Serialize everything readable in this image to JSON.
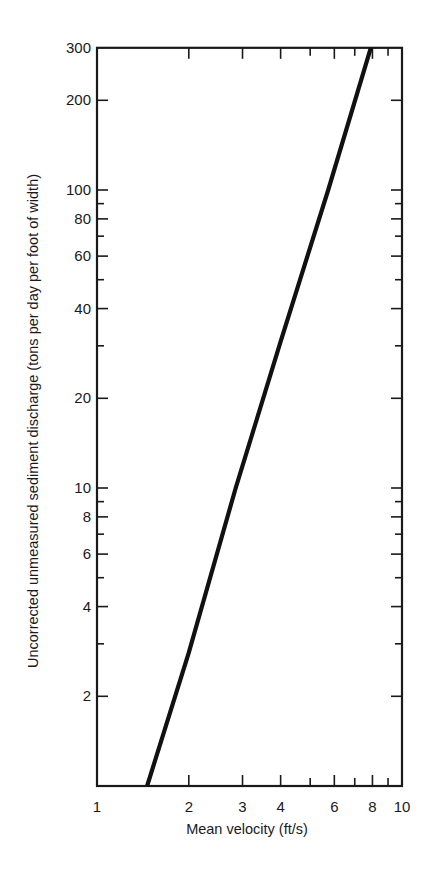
{
  "chart_data": {
    "type": "line",
    "title": "",
    "xlabel": "Mean velocity (ft/s)",
    "ylabel": "Uncorrected unmeasured sediment discharge (tons per day per foot of width)",
    "xscale": "log",
    "yscale": "log",
    "xlim": [
      1,
      10
    ],
    "ylim": [
      1,
      300
    ],
    "grid": false,
    "legend": null,
    "x_ticks": {
      "major_labeled": [
        1,
        2,
        3,
        4,
        6,
        8,
        10
      ],
      "labels": [
        "1",
        "2",
        "3",
        "4",
        "6",
        "8",
        "10"
      ],
      "minor": [
        5,
        7,
        9
      ]
    },
    "y_ticks": {
      "labeled": [
        2,
        4,
        6,
        8,
        10,
        20,
        40,
        60,
        80,
        100,
        200,
        300
      ],
      "labels": [
        "2",
        "4",
        "6",
        "8",
        "10",
        "20",
        "40",
        "60",
        "80",
        "100",
        "200",
        "300"
      ],
      "minor": [
        3,
        5,
        7,
        9,
        30,
        50,
        70,
        90
      ]
    },
    "series": [
      {
        "name": "Unmeasured sediment discharge vs. mean velocity",
        "x": [
          1.46,
          2.0,
          2.85,
          4.0,
          5.73,
          7.9
        ],
        "y": [
          1.0,
          2.8,
          10,
          31,
          100,
          300
        ]
      }
    ]
  },
  "text": {
    "xlabel": "Mean velocity (ft/s)",
    "ylabel": "Uncorrected unmeasured sediment discharge (tons per day per foot of width)"
  }
}
